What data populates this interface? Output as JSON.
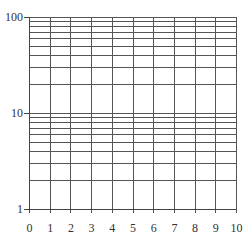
{
  "chart_data": {
    "type": "line",
    "title": "",
    "xlabel": "",
    "ylabel": "",
    "x_scale": "linear",
    "y_scale": "log",
    "xlim": [
      0,
      10
    ],
    "ylim": [
      1,
      100
    ],
    "x_ticks": [
      0,
      1,
      2,
      3,
      4,
      5,
      6,
      7,
      8,
      9,
      10
    ],
    "x_tick_labels": [
      "0",
      "1",
      "2",
      "3",
      "4",
      "5",
      "6",
      "7",
      "8",
      "9",
      "10"
    ],
    "y_ticks": [
      1,
      10,
      100
    ],
    "y_tick_labels": [
      "1",
      "10",
      "100"
    ],
    "y_minor_gridlines": [
      2,
      3,
      4,
      5,
      6,
      7,
      8,
      9,
      20,
      30,
      40,
      50,
      60,
      70,
      80,
      90
    ],
    "grid": true,
    "legend": null,
    "series": []
  },
  "colors": {
    "grid": "#555555",
    "axis": "#444444",
    "text": "#333333",
    "background": "#ffffff"
  },
  "layout": {
    "plot_left": 29,
    "plot_right": 236,
    "plot_top": 17,
    "plot_bottom": 209
  }
}
